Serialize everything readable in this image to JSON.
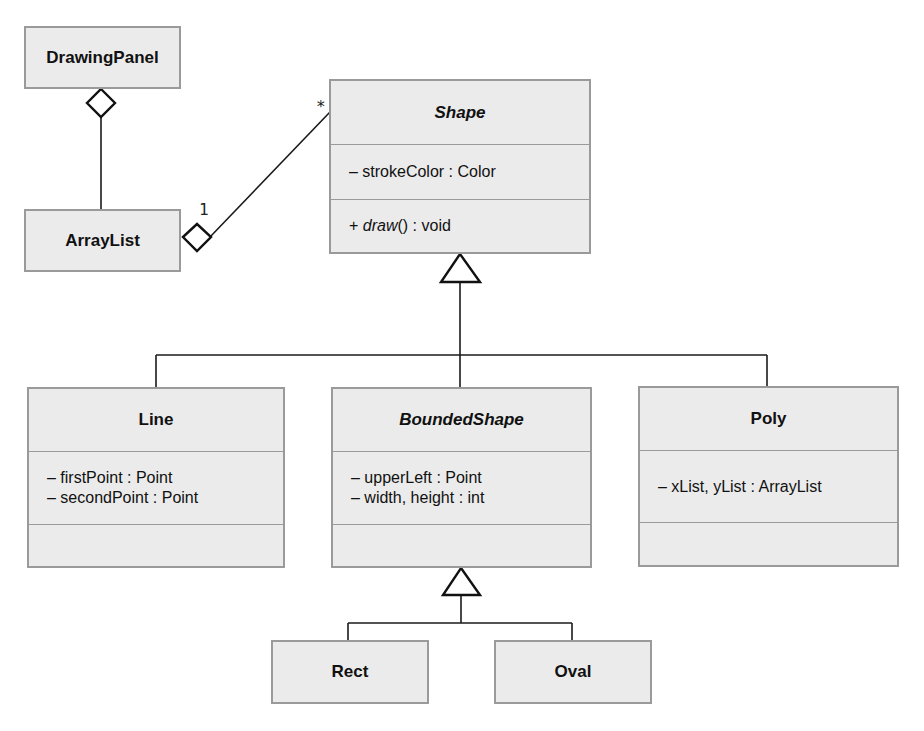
{
  "diagram": {
    "type": "uml-class-diagram",
    "classes": {
      "drawing_panel": {
        "name": "DrawingPanel",
        "abstract": false
      },
      "array_list": {
        "name": "ArrayList",
        "abstract": false
      },
      "shape": {
        "name": "Shape",
        "abstract": true,
        "attributes": [
          "– strokeColor : Color"
        ],
        "operations": [
          {
            "prefix": "+ ",
            "name": "draw",
            "suffix": "() : void",
            "abstract": true
          }
        ]
      },
      "line": {
        "name": "Line",
        "abstract": false,
        "attributes": [
          "– firstPoint : Point",
          "– secondPoint : Point"
        ],
        "operations": []
      },
      "bounded_shape": {
        "name": "BoundedShape",
        "abstract": true,
        "attributes": [
          "– upperLeft : Point",
          "– width, height : int"
        ],
        "operations": []
      },
      "poly": {
        "name": "Poly",
        "abstract": false,
        "attributes": [
          "– xList, yList : ArrayList"
        ],
        "operations": []
      },
      "rect": {
        "name": "Rect",
        "abstract": false
      },
      "oval": {
        "name": "Oval",
        "abstract": false
      }
    },
    "relationships": [
      {
        "type": "aggregation",
        "whole": "DrawingPanel",
        "part": "ArrayList"
      },
      {
        "type": "aggregation",
        "whole": "ArrayList",
        "part": "Shape",
        "whole_multiplicity": "1",
        "part_multiplicity": "*"
      },
      {
        "type": "generalization",
        "parent": "Shape",
        "children": [
          "Line",
          "BoundedShape",
          "Poly"
        ]
      },
      {
        "type": "generalization",
        "parent": "BoundedShape",
        "children": [
          "Rect",
          "Oval"
        ]
      }
    ],
    "multiplicities": {
      "array_list_end": "1",
      "shape_end": "*"
    },
    "colors": {
      "box_fill": "#ebebeb",
      "box_border": "#9a9a9a",
      "line": "#1a1a1a"
    }
  }
}
